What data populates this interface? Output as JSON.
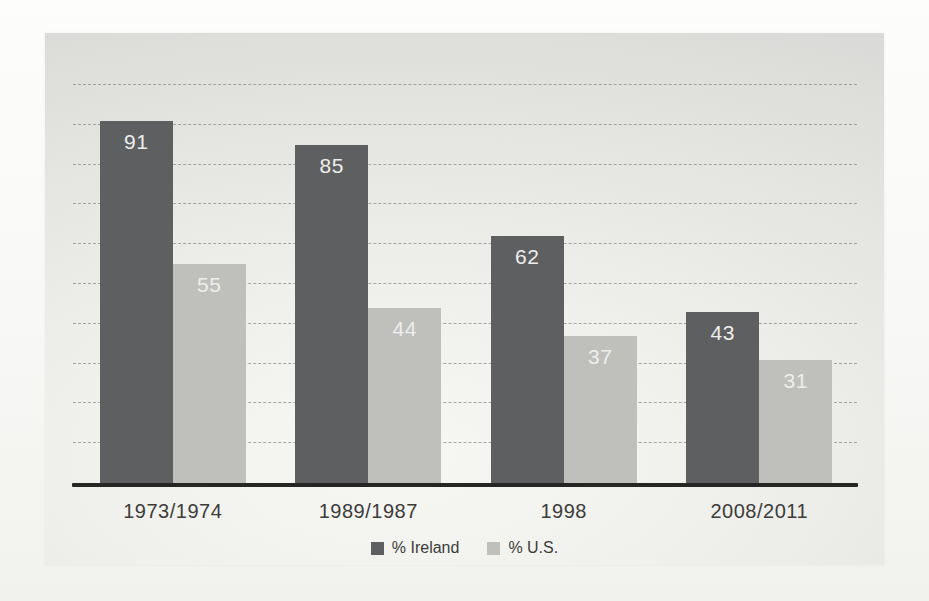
{
  "chart_data": {
    "type": "bar",
    "title": "",
    "xlabel": "",
    "ylabel": "",
    "categories": [
      "1973/1974",
      "1989/1987",
      "1998",
      "2008/2011"
    ],
    "series": [
      {
        "name": "% Ireland",
        "color": "#5e5f61",
        "values": [
          91,
          85,
          62,
          43
        ]
      },
      {
        "name": "% U.S.",
        "color": "#bfc0bc",
        "values": [
          55,
          44,
          37,
          31
        ]
      }
    ],
    "ylim": [
      0,
      100
    ],
    "grid": {
      "show": true,
      "interval": 10,
      "style": "dashed",
      "color": "#8c8c8a"
    },
    "legend_position": "bottom",
    "value_labels": {
      "show": true,
      "position": "inside-top",
      "color": "#eeeeec"
    },
    "axis_line_color": "#262625",
    "panel_background": [
      "#f7f7f4",
      "#e3e3e0",
      "#d8d8d6"
    ]
  }
}
